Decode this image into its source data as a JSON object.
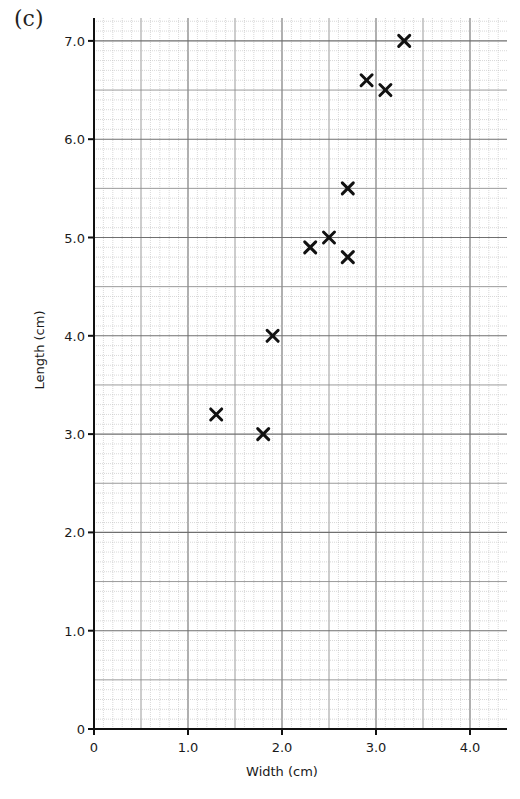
{
  "panel_label": "(c)",
  "chart_data": {
    "type": "scatter",
    "title": "",
    "xlabel": "Width (cm)",
    "ylabel": "Length (cm)",
    "xlim": [
      0,
      4.4
    ],
    "ylim": [
      0,
      7.2
    ],
    "x_ticks": [
      0,
      1.0,
      2.0,
      3.0,
      4.0
    ],
    "x_tick_labels": [
      "0",
      "1.0",
      "2.0",
      "3.0",
      "4.0"
    ],
    "y_ticks": [
      0,
      1.0,
      2.0,
      3.0,
      4.0,
      5.0,
      6.0,
      7.0
    ],
    "y_tick_labels": [
      "0",
      "1.0",
      "2.0",
      "3.0",
      "4.0",
      "5.0",
      "6.0",
      "7.0"
    ],
    "grid": {
      "on": true,
      "style": "graph-paper",
      "minor_step": 0.1,
      "medium_step": 0.5,
      "major_step": 1.0
    },
    "marker": "x",
    "series": [
      {
        "name": "specimens",
        "points": [
          {
            "x": 1.3,
            "y": 3.2
          },
          {
            "x": 1.8,
            "y": 3.0
          },
          {
            "x": 1.9,
            "y": 4.0
          },
          {
            "x": 2.3,
            "y": 4.9
          },
          {
            "x": 2.5,
            "y": 5.0
          },
          {
            "x": 2.7,
            "y": 4.8
          },
          {
            "x": 2.7,
            "y": 5.5
          },
          {
            "x": 2.9,
            "y": 6.6
          },
          {
            "x": 3.1,
            "y": 6.5
          },
          {
            "x": 3.3,
            "y": 7.0
          }
        ]
      }
    ]
  },
  "colors": {
    "axis": "#111111",
    "minor_grid": "#bdbdbd",
    "medium_grid": "#8f8f8f",
    "major_grid": "#6f6f6f",
    "marker": "#111111"
  }
}
